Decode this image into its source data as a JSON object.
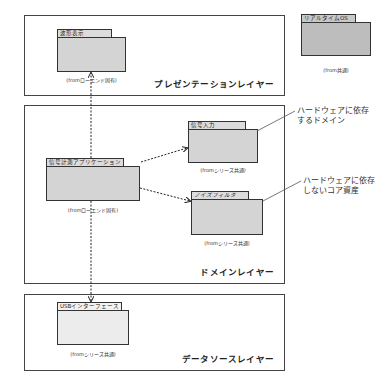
{
  "layers": {
    "presentation": {
      "title": "プレゼンテーションレイヤー"
    },
    "domain": {
      "title": "ドメインレイヤー"
    },
    "datasource": {
      "title": "データソースレイヤー"
    }
  },
  "packages": {
    "waveform": {
      "name": "波形表示",
      "from": "(fromローエンド固有)"
    },
    "realtime_os": {
      "name": "リアルタイムOS",
      "from": "(from共通)"
    },
    "signal_app": {
      "name": "信号計測アプリケーション",
      "from": "(fromローエンド固有)"
    },
    "signal_input": {
      "name": "信号入力",
      "from": "(fromシリーズ共通)"
    },
    "noise_filter": {
      "name": "ノイズフィルタ",
      "from": "(fromシリーズ共通)"
    },
    "usb_interface": {
      "name": "USBインターフェース",
      "from": "(fromシリーズ共通)"
    }
  },
  "callouts": {
    "hw_dependent": {
      "line1": "ハードウェアに依存",
      "line2": "するドメイン"
    },
    "hw_independent": {
      "line1": "ハードウェアに依存",
      "line2": "しないコア資産"
    }
  }
}
